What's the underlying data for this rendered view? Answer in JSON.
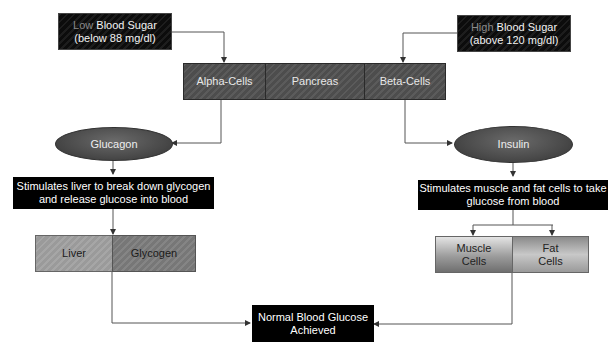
{
  "diagram": {
    "low_sugar": {
      "prefix": "Low",
      "title": "Blood Sugar",
      "detail": "(below 88 mg/dl)"
    },
    "high_sugar": {
      "prefix": "High",
      "title": "Blood Sugar",
      "detail": "(above 120 mg/dl)"
    },
    "pancreas": {
      "left": "Alpha-Cells",
      "center": "Pancreas",
      "right": "Beta-Cells"
    },
    "glucagon": "Glucagon",
    "insulin": "Insulin",
    "liver_action": {
      "line1": "Stimulates liver to break down glycogen",
      "line2": "and release glucose into blood"
    },
    "insulin_action": {
      "line1": "Stimulates muscle and fat cells to take",
      "line2": "glucose from blood"
    },
    "liver_box": {
      "left": "Liver",
      "right": "Glycogen"
    },
    "cells_box": {
      "left_line1": "Muscle",
      "left_line2": "Cells",
      "right_line1": "Fat",
      "right_line2": "Cells"
    },
    "result": {
      "line1": "Normal Blood Glucose",
      "line2": "Achieved"
    }
  }
}
